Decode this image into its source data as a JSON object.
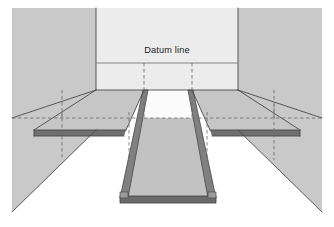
{
  "figure": {
    "kind": "perspective-line-drawing",
    "annotations": {
      "datum_line_label": "Datum line"
    },
    "colors": {
      "page_background": "#ffffff",
      "back_wall": "#ececec",
      "side_wall": "#c9c9c9",
      "platform_top": "#c6c6c6",
      "platform_face_dark": "#6f6f6f",
      "ramp_top": "#c2c2c2",
      "ramp_edge_dark": "#5f5f5f",
      "floor": "#ffffff",
      "outline": "#4a4a4a",
      "construction_line": "#6a6a6a",
      "label_text": "#1d1d1d"
    },
    "geometry": {
      "frame": {
        "left": 12,
        "top": 8,
        "right": 322,
        "bottom": 212
      },
      "back_wall": {
        "left": 96,
        "top": 8,
        "right": 238,
        "bottom": 90
      },
      "datum_line_y": 63,
      "horizontal_dashed_datum_y": 118,
      "vertical_dashed_x": [
        144,
        192
      ],
      "platform_top_y": 90,
      "platform_front_y": 130,
      "ramp_bottom_y": 200,
      "ramp_top_width": 48,
      "ramp_bottom_width": 106
    },
    "elements": [
      {
        "name": "back-wall",
        "label": "Back wall"
      },
      {
        "name": "left-side-wall",
        "label": "Left side wall"
      },
      {
        "name": "right-side-wall",
        "label": "Right side wall"
      },
      {
        "name": "raised-platform",
        "label": "Raised platform"
      },
      {
        "name": "access-ramp",
        "label": "Access ramp"
      },
      {
        "name": "floor",
        "label": "Floor"
      },
      {
        "name": "datum-line",
        "label": "Datum line"
      }
    ]
  }
}
